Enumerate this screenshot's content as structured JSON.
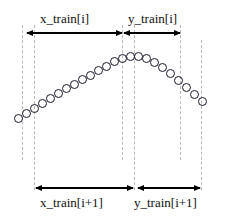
{
  "figure": {
    "width": 226,
    "height": 221,
    "background": "#ffffff",
    "stroke_color": "#1a1a2e",
    "dashed_color": "#b9b9b9",
    "arrow_color": "#000000"
  },
  "labels": {
    "top_left": "x_train[i]",
    "top_right": "y_train[i]",
    "bottom_left": "x_train[i+1]",
    "bottom_right": "y_train[i+1]"
  },
  "chart_data": {
    "type": "scatter",
    "title": "",
    "xlabel": "",
    "ylabel": "",
    "grid": false,
    "legend": null,
    "marker": "open-circle",
    "marker_diameter": 9,
    "point_count": 24,
    "points": [
      {
        "x": 18,
        "y": 118
      },
      {
        "x": 26,
        "y": 113
      },
      {
        "x": 34,
        "y": 108
      },
      {
        "x": 42,
        "y": 103
      },
      {
        "x": 50,
        "y": 98
      },
      {
        "x": 58,
        "y": 93
      },
      {
        "x": 66,
        "y": 88
      },
      {
        "x": 74,
        "y": 84
      },
      {
        "x": 82,
        "y": 79
      },
      {
        "x": 90,
        "y": 75
      },
      {
        "x": 98,
        "y": 70
      },
      {
        "x": 106,
        "y": 66
      },
      {
        "x": 114,
        "y": 61
      },
      {
        "x": 122,
        "y": 58
      },
      {
        "x": 130,
        "y": 56
      },
      {
        "x": 138,
        "y": 56
      },
      {
        "x": 146,
        "y": 58
      },
      {
        "x": 154,
        "y": 62
      },
      {
        "x": 162,
        "y": 67
      },
      {
        "x": 170,
        "y": 73
      },
      {
        "x": 178,
        "y": 80
      },
      {
        "x": 186,
        "y": 87
      },
      {
        "x": 194,
        "y": 94
      },
      {
        "x": 202,
        "y": 101
      }
    ],
    "annotations": [
      {
        "name": "top-left-span",
        "label": "x_train[i]",
        "x_start": 27,
        "x_end": 122,
        "y": 33
      },
      {
        "name": "top-right-span",
        "label": "y_train[i]",
        "x_start": 124,
        "x_end": 180,
        "y": 33
      },
      {
        "name": "bottom-left-span",
        "label": "x_train[i+1]",
        "x_start": 36,
        "x_end": 133,
        "y": 188
      },
      {
        "name": "bottom-right-span",
        "label": "y_train[i+1]",
        "x_start": 138,
        "x_end": 200,
        "y": 188
      }
    ],
    "guide_lines": [
      {
        "name": "guide-1",
        "x": 22,
        "y_top": 25,
        "y_bottom": 160
      },
      {
        "name": "guide-2",
        "x": 34,
        "y_top": 25,
        "y_bottom": 190
      },
      {
        "name": "guide-3",
        "x": 122,
        "y_top": 25,
        "y_bottom": 160
      },
      {
        "name": "guide-4",
        "x": 134,
        "y_top": 25,
        "y_bottom": 190
      },
      {
        "name": "guide-5",
        "x": 180,
        "y_top": 25,
        "y_bottom": 160
      },
      {
        "name": "guide-6",
        "x": 201,
        "y_top": 40,
        "y_bottom": 190
      }
    ]
  }
}
